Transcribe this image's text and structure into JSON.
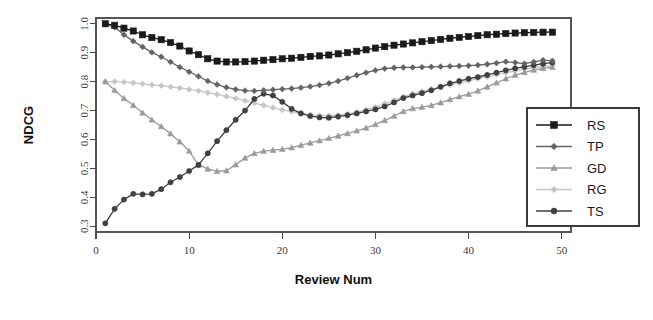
{
  "chart_data": {
    "type": "line",
    "title": "",
    "xlabel": "Review Num",
    "ylabel": "NDCG",
    "xlim": [
      0,
      51
    ],
    "ylim": [
      0.28,
      1.02
    ],
    "xticks": [
      0,
      10,
      20,
      30,
      40,
      50
    ],
    "xticklabels": [
      "0",
      "10",
      "20",
      "30",
      "40",
      "50"
    ],
    "yticks": [
      0.3,
      0.4,
      0.5,
      0.6,
      0.7,
      0.8,
      0.9,
      1.0
    ],
    "yticklabels": [
      "0.3",
      "0.4",
      "0.5",
      "0.6",
      "0.7",
      "0.8",
      "0.9",
      "1.0"
    ],
    "grid": false,
    "legend_position": "bottom-right",
    "x": [
      1,
      2,
      3,
      4,
      5,
      6,
      7,
      8,
      9,
      10,
      11,
      12,
      13,
      14,
      15,
      16,
      17,
      18,
      19,
      20,
      21,
      22,
      23,
      24,
      25,
      26,
      27,
      28,
      29,
      30,
      31,
      32,
      33,
      34,
      35,
      36,
      37,
      38,
      39,
      40,
      41,
      42,
      43,
      44,
      45,
      46,
      47,
      48,
      49
    ],
    "series": [
      {
        "name": "RS",
        "color": "#1a1a1a",
        "marker": "square",
        "values": [
          1.0,
          0.995,
          0.985,
          0.975,
          0.962,
          0.952,
          0.945,
          0.935,
          0.923,
          0.906,
          0.893,
          0.879,
          0.871,
          0.868,
          0.868,
          0.869,
          0.871,
          0.874,
          0.876,
          0.879,
          0.881,
          0.884,
          0.887,
          0.889,
          0.892,
          0.896,
          0.9,
          0.905,
          0.91,
          0.916,
          0.921,
          0.926,
          0.93,
          0.934,
          0.938,
          0.942,
          0.946,
          0.95,
          0.953,
          0.956,
          0.959,
          0.962,
          0.964,
          0.966,
          0.968,
          0.969,
          0.97,
          0.971,
          0.971
        ]
      },
      {
        "name": "TP",
        "color": "#636363",
        "marker": "diamond",
        "values": [
          1.0,
          0.988,
          0.962,
          0.94,
          0.92,
          0.901,
          0.886,
          0.868,
          0.85,
          0.834,
          0.818,
          0.802,
          0.79,
          0.78,
          0.773,
          0.769,
          0.768,
          0.77,
          0.772,
          0.774,
          0.776,
          0.779,
          0.783,
          0.788,
          0.794,
          0.802,
          0.812,
          0.822,
          0.831,
          0.839,
          0.845,
          0.848,
          0.849,
          0.849,
          0.85,
          0.851,
          0.852,
          0.853,
          0.854,
          0.855,
          0.857,
          0.86,
          0.864,
          0.869,
          0.866,
          0.862,
          0.868,
          0.874,
          0.872
        ]
      },
      {
        "name": "GD",
        "color": "#9a9a9a",
        "marker": "triangle",
        "values": [
          0.8,
          0.77,
          0.742,
          0.718,
          0.692,
          0.668,
          0.645,
          0.62,
          0.592,
          0.56,
          0.512,
          0.498,
          0.49,
          0.492,
          0.513,
          0.536,
          0.552,
          0.56,
          0.563,
          0.566,
          0.572,
          0.58,
          0.588,
          0.596,
          0.604,
          0.612,
          0.621,
          0.63,
          0.64,
          0.652,
          0.666,
          0.681,
          0.697,
          0.707,
          0.712,
          0.718,
          0.727,
          0.738,
          0.748,
          0.757,
          0.768,
          0.782,
          0.796,
          0.81,
          0.822,
          0.832,
          0.84,
          0.846,
          0.85
        ]
      },
      {
        "name": "RG",
        "color": "#c6c6c6",
        "marker": "diamond",
        "values": [
          0.8,
          0.8,
          0.798,
          0.796,
          0.792,
          0.789,
          0.786,
          0.782,
          0.778,
          0.773,
          0.768,
          0.762,
          0.756,
          0.749,
          0.742,
          0.734,
          0.726,
          0.718,
          0.71,
          0.702,
          0.696,
          0.69,
          0.686,
          0.683,
          0.682,
          0.684,
          0.688,
          0.694,
          0.702,
          0.712,
          0.724,
          0.736,
          0.748,
          0.758,
          0.766,
          0.774,
          0.782,
          0.789,
          0.796,
          0.803,
          0.81,
          0.817,
          0.824,
          0.831,
          0.837,
          0.843,
          0.848,
          0.852,
          0.856
        ]
      },
      {
        "name": "TS",
        "color": "#404040",
        "marker": "circle",
        "values": [
          0.31,
          0.36,
          0.392,
          0.412,
          0.41,
          0.412,
          0.428,
          0.452,
          0.47,
          0.491,
          0.512,
          0.552,
          0.594,
          0.632,
          0.668,
          0.7,
          0.74,
          0.758,
          0.752,
          0.73,
          0.706,
          0.69,
          0.681,
          0.676,
          0.675,
          0.679,
          0.684,
          0.69,
          0.697,
          0.704,
          0.714,
          0.728,
          0.743,
          0.752,
          0.76,
          0.77,
          0.782,
          0.794,
          0.802,
          0.81,
          0.816,
          0.823,
          0.831,
          0.839,
          0.846,
          0.851,
          0.857,
          0.862,
          0.866
        ]
      }
    ]
  },
  "legend": {
    "entries": [
      {
        "label": "RS"
      },
      {
        "label": "TP"
      },
      {
        "label": "GD"
      },
      {
        "label": "RG"
      },
      {
        "label": "TS"
      }
    ]
  }
}
